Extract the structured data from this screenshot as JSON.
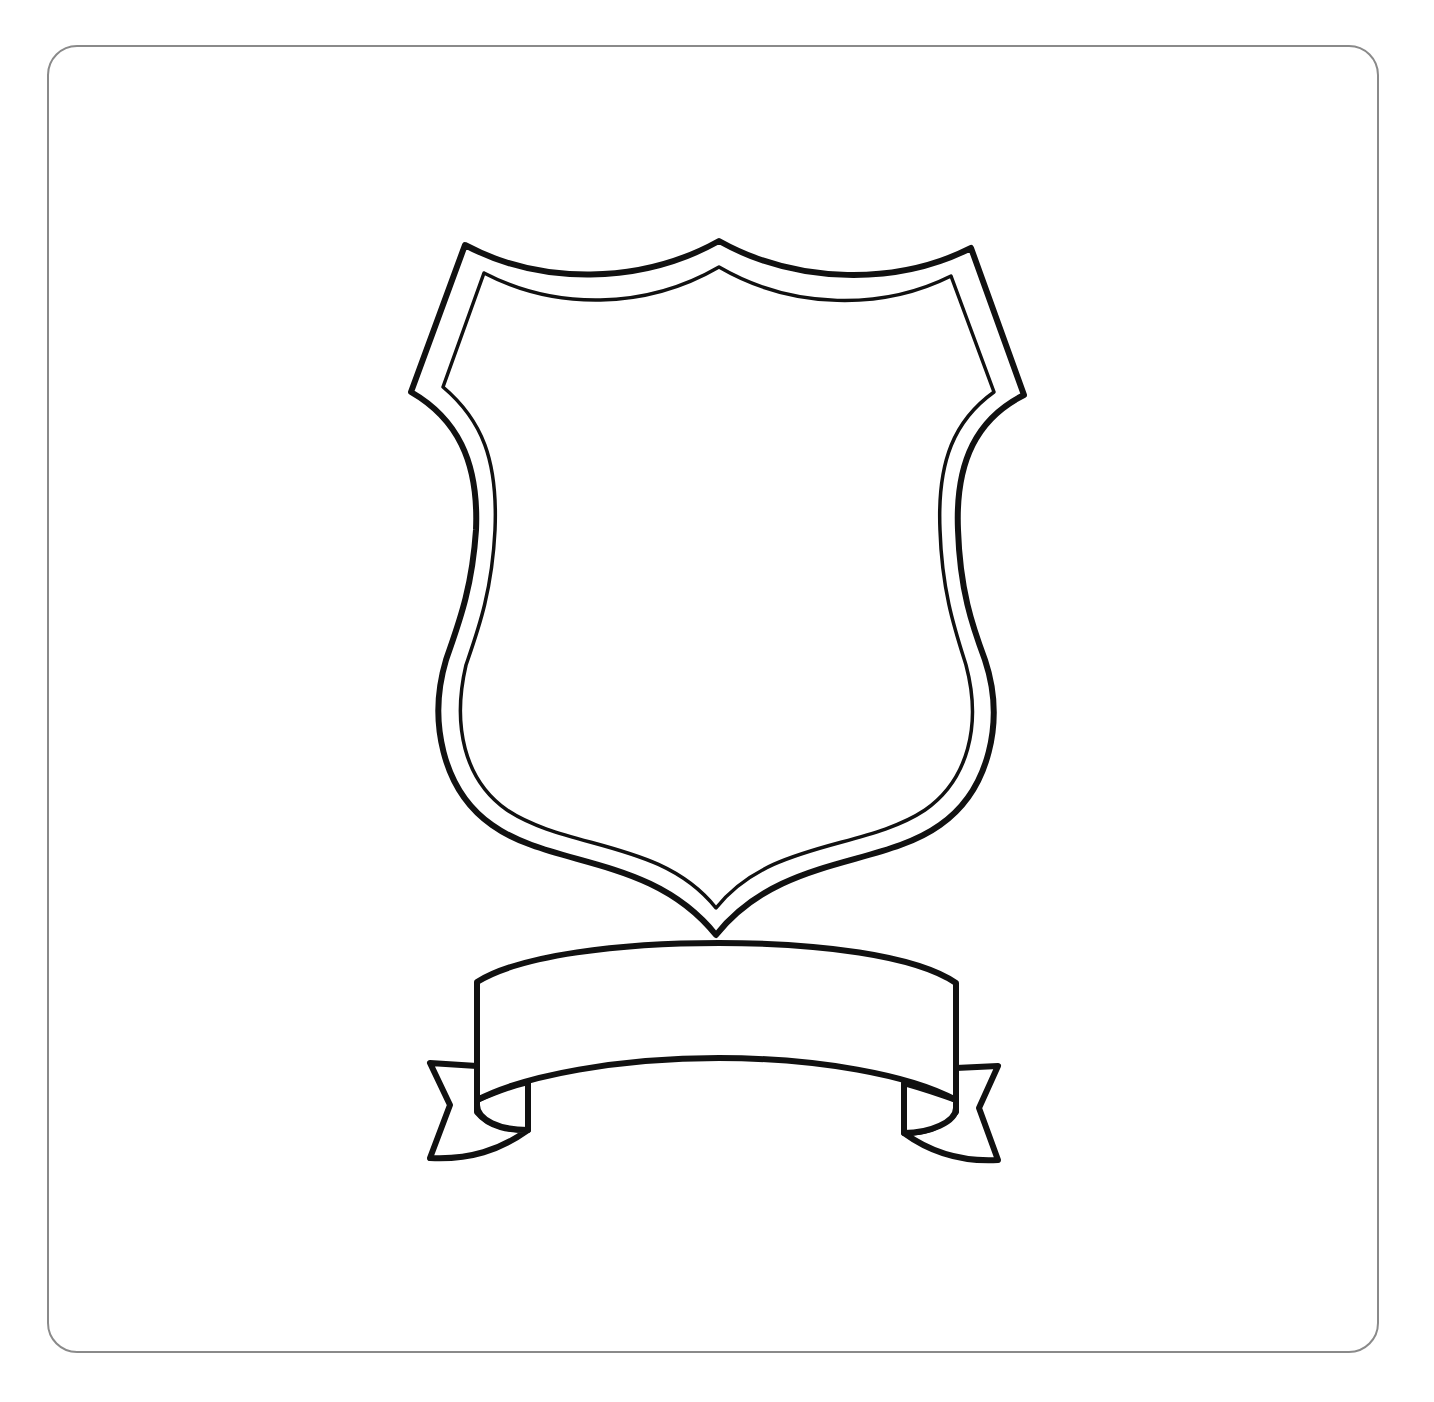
{
  "artwork": {
    "subject": "blank shield with ribbon banner",
    "shield": {
      "label": ""
    },
    "banner": {
      "label": ""
    }
  },
  "colors": {
    "frame_border": "#8a8a8a",
    "outline": "#111111",
    "background": "#ffffff"
  }
}
